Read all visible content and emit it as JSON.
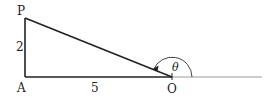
{
  "diagram": {
    "type": "right-triangle-angle",
    "vertices": {
      "P": {
        "label": "P",
        "x": 25,
        "y": 18
      },
      "A": {
        "label": "A",
        "x": 25,
        "y": 77
      },
      "O": {
        "label": "O",
        "x": 172,
        "y": 77
      }
    },
    "side_labels": {
      "PA": "2",
      "AO": "5"
    },
    "angle": {
      "symbol": "θ",
      "at": "O",
      "from": "positive x-axis",
      "to": "OP"
    },
    "colors": {
      "triangle": "#222222",
      "axis": "#9a9a9a",
      "arc": "#444444"
    }
  }
}
